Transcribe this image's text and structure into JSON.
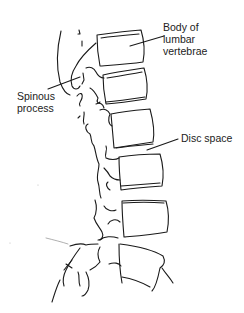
{
  "diagram": {
    "labels": {
      "body_of_lumbar_vertebrae": [
        "Body of",
        "lumbar",
        "vertebrae"
      ],
      "spinous_process": [
        "Spinous",
        "process"
      ],
      "disc_space": [
        "Disc space"
      ]
    },
    "colors": {
      "line": "#1a1a1a",
      "text": "#222222",
      "background": "#ffffff"
    }
  }
}
